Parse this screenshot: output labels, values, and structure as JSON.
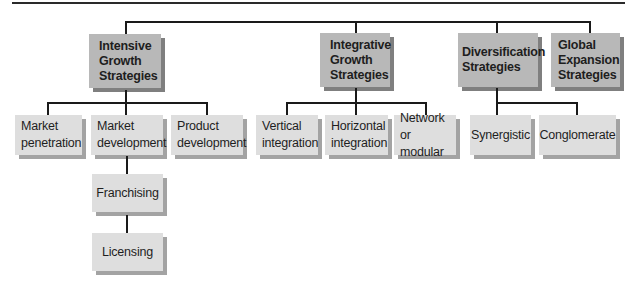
{
  "diagram": {
    "categories": [
      {
        "label_lines": [
          "Intensive",
          "Growth",
          "Strategies"
        ],
        "children": [
          {
            "label_lines": [
              "Market",
              "penetration"
            ]
          },
          {
            "label_lines": [
              "Market",
              "development"
            ],
            "children": [
              {
                "label_lines": [
                  "Franchising"
                ]
              },
              {
                "label_lines": [
                  "Licensing"
                ]
              }
            ]
          },
          {
            "label_lines": [
              "Product",
              "development"
            ]
          }
        ]
      },
      {
        "label_lines": [
          "Integrative",
          "Growth",
          "Strategies"
        ],
        "children": [
          {
            "label_lines": [
              "Vertical",
              "integration"
            ]
          },
          {
            "label_lines": [
              "Horizontal",
              "integration"
            ]
          },
          {
            "label_lines": [
              "Network",
              "or modular"
            ]
          }
        ]
      },
      {
        "label_lines": [
          "Diversification",
          "Strategies"
        ],
        "children": [
          {
            "label_lines": [
              "Synergistic"
            ]
          },
          {
            "label_lines": [
              "Conglomerate"
            ]
          }
        ]
      },
      {
        "label_lines": [
          "Global",
          "Expansion",
          "Strategies"
        ],
        "children": []
      }
    ],
    "colors": {
      "top_box": "#b8b8b8",
      "sub_box": "#dedede",
      "line": "#1a1a1a"
    }
  }
}
